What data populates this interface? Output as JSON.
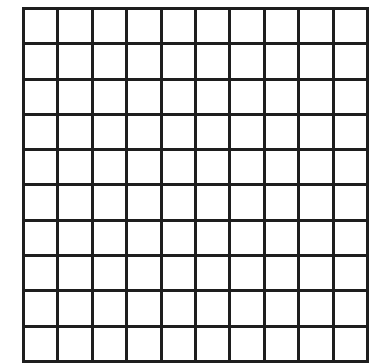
{
  "diagram": {
    "type": "grid",
    "rows": 10,
    "cols": 10,
    "line_color": "#1e1e1e",
    "fill_color": "#ffffff",
    "shaded_cells": []
  }
}
